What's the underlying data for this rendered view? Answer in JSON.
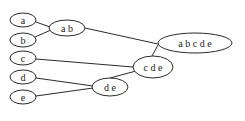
{
  "diagram": {
    "type": "hierarchical-clustering-tree",
    "nodes": [
      {
        "id": "a",
        "label": "a",
        "cx": 23,
        "cy": 20,
        "rx": 13,
        "ry": 7
      },
      {
        "id": "b",
        "label": "b",
        "cx": 23,
        "cy": 40,
        "rx": 13,
        "ry": 7
      },
      {
        "id": "c",
        "label": "c",
        "cx": 23,
        "cy": 58,
        "rx": 13,
        "ry": 7
      },
      {
        "id": "d",
        "label": "d",
        "cx": 23,
        "cy": 77,
        "rx": 13,
        "ry": 7
      },
      {
        "id": "e",
        "label": "e",
        "cx": 23,
        "cy": 97,
        "rx": 13,
        "ry": 7
      },
      {
        "id": "ab",
        "label": "a  b",
        "cx": 67,
        "cy": 28,
        "rx": 18,
        "ry": 8
      },
      {
        "id": "de",
        "label": "d  e",
        "cx": 110,
        "cy": 87,
        "rx": 18,
        "ry": 9
      },
      {
        "id": "cde",
        "label": "c  d  e",
        "cx": 153,
        "cy": 67,
        "rx": 20,
        "ry": 11
      },
      {
        "id": "abcde",
        "label": "a  b  c  d  e",
        "cx": 195,
        "cy": 43,
        "rx": 37,
        "ry": 10
      }
    ],
    "edges": [
      {
        "from": "a",
        "to": "ab",
        "x1": 36,
        "y1": 22,
        "x2": 50,
        "y2": 27
      },
      {
        "from": "b",
        "to": "ab",
        "x1": 35,
        "y1": 37,
        "x2": 51,
        "y2": 30
      },
      {
        "from": "ab",
        "to": "abcde",
        "x1": 85,
        "y1": 28,
        "x2": 158,
        "y2": 44
      },
      {
        "from": "c",
        "to": "cde",
        "x1": 36,
        "y1": 59,
        "x2": 133,
        "y2": 67
      },
      {
        "from": "cde",
        "to": "abcde",
        "x1": 152,
        "y1": 56,
        "x2": 158,
        "y2": 45
      },
      {
        "from": "d",
        "to": "de",
        "x1": 36,
        "y1": 78,
        "x2": 93,
        "y2": 86
      },
      {
        "from": "e",
        "to": "de",
        "x1": 36,
        "y1": 96,
        "x2": 93,
        "y2": 88
      },
      {
        "from": "de",
        "to": "cde",
        "x1": 110,
        "y1": 78,
        "x2": 136,
        "y2": 71
      }
    ]
  }
}
